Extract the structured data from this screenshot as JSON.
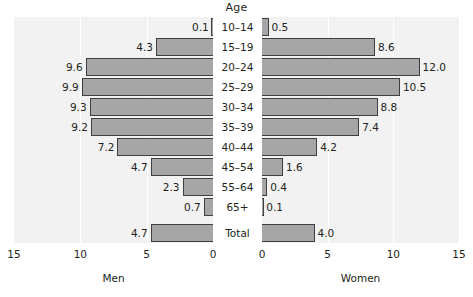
{
  "chart_data": {
    "type": "bar",
    "subtype": "population-pyramid",
    "title": "Age",
    "categories": [
      "10–14",
      "15–19",
      "20–24",
      "25–29",
      "30–34",
      "35–39",
      "40–44",
      "45–54",
      "55–64",
      "65+",
      "Total"
    ],
    "series": [
      {
        "name": "Men",
        "values": [
          0.1,
          4.3,
          9.6,
          9.9,
          9.3,
          9.2,
          7.2,
          4.7,
          2.3,
          0.7,
          4.7
        ]
      },
      {
        "name": "Women",
        "values": [
          0.5,
          8.6,
          12.0,
          10.5,
          8.8,
          7.4,
          4.2,
          1.6,
          0.4,
          0.1,
          4.0
        ]
      }
    ],
    "value_labels": {
      "men": [
        "0.1",
        "4.3",
        "9.6",
        "9.9",
        "9.3",
        "9.2",
        "7.2",
        "4.7",
        "2.3",
        "0.7",
        "4.7"
      ],
      "women": [
        "0.5",
        "8.6",
        "12.0",
        "10.5",
        "8.8",
        "7.4",
        "4.2",
        "1.6",
        "0.4",
        "0.1",
        "4.0"
      ]
    },
    "xlabel_left": "Men",
    "xlabel_right": "Women",
    "ylabel": "Age",
    "xlim": [
      0,
      15
    ],
    "ticks": [
      "15",
      "10",
      "5",
      "0",
      "0",
      "5",
      "10",
      "15"
    ],
    "left_ticks": [
      "15",
      "10",
      "5",
      "0"
    ],
    "right_ticks": [
      "0",
      "5",
      "10",
      "15"
    ],
    "grid": true,
    "legend": "none",
    "colors": {
      "bar": "#a6a6a6",
      "bar_edge": "#3f3f3f",
      "panel_background": "#f2f2f2",
      "gridline": "#ffffff",
      "page_background": "#ffffff",
      "text": "#231f20"
    }
  },
  "axis": {
    "top_title": "Age",
    "bottom_left_label": "Men",
    "bottom_right_label": "Women"
  }
}
